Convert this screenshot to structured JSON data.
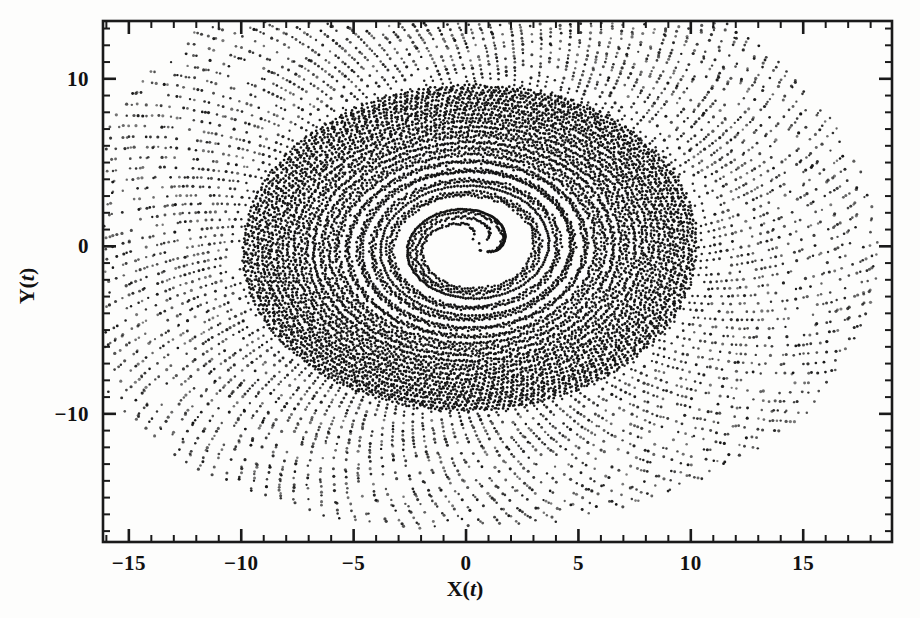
{
  "figure": {
    "name": "phase-portrait-scatter",
    "background_color": "#fdfdfc",
    "ink_color": "#141414"
  },
  "axes": {
    "x_title_main": "X(",
    "x_title_var": "t",
    "x_title_close": ")",
    "y_title_main": "Y(",
    "y_title_var": "t",
    "y_title_close": ")",
    "x_tick_labels": [
      "-15",
      "-10",
      "-5",
      "0",
      "5",
      "10",
      "15"
    ],
    "x_tick_values": [
      -15,
      -10,
      -5,
      0,
      5,
      10,
      15
    ],
    "y_tick_labels": [
      "10",
      "0",
      "-10"
    ],
    "y_tick_values": [
      10,
      0,
      -10
    ],
    "x_minor_step": 1,
    "y_minor_step": 1
  },
  "chart_data": {
    "type": "scatter",
    "title": "",
    "subtitle": "",
    "xlabel": "X(t)",
    "ylabel": "Y(t)",
    "xlim": [
      -16.15,
      18.95
    ],
    "ylim": [
      -17.65,
      13.45
    ],
    "grid": false,
    "legend": null,
    "annotations": [],
    "marker": {
      "shape": "point",
      "color": "#141414",
      "size_px": 1.6
    },
    "sampling": {
      "n_points": 9000,
      "note": "points generated by a spiral sweep in polar coordinates"
    },
    "spiral_model": {
      "center_x": 0.15,
      "center_y": -0.05,
      "radius_min": 0.55,
      "radius_max": 16.6,
      "growth_exponent": 2.35,
      "ellipse_ratio_y_over_x": 0.96,
      "tilt_deg": -19.0,
      "turns": 57,
      "phase_modulation_amp": 0.045,
      "radial_jitter": 0.12,
      "outer_taper_start": 0.78
    },
    "data_extent_observed": {
      "x_min": -14.5,
      "x_max": 18.4,
      "y_min": -16.5,
      "y_max": 12.7
    },
    "series": [
      {
        "name": "trajectory",
        "color": "#141414",
        "x": [],
        "y": []
      }
    ]
  }
}
